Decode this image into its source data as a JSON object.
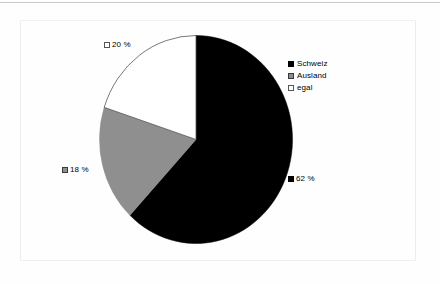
{
  "chart_data": {
    "type": "pie",
    "title": "",
    "subtitle": "",
    "categories": [
      "Schweiz",
      "Ausland",
      "egal"
    ],
    "values": [
      62,
      18,
      20
    ],
    "unit": "%",
    "start_angle_deg": 0,
    "direction": "clockwise",
    "legend_position": "right",
    "grid": false,
    "slice_colors": [
      "#000000",
      "#8f8f8f",
      "#ffffff"
    ],
    "slices": [
      {
        "label": "Schweiz",
        "value": 62,
        "value_text": "62 %",
        "color": "#000000",
        "marker": "black"
      },
      {
        "label": "Ausland",
        "value": 18,
        "value_text": "18 %",
        "color": "#8f8f8f",
        "marker": "gray"
      },
      {
        "label": "egal",
        "value": 20,
        "value_text": "20 %",
        "color": "#ffffff",
        "marker": "white"
      }
    ],
    "data_labels": [
      {
        "id": "egal",
        "text": "20 %",
        "marker": "white"
      },
      {
        "id": "ausland",
        "text": "18 %",
        "marker": "gray"
      },
      {
        "id": "schweiz",
        "text": "62 %",
        "marker": "black"
      }
    ]
  },
  "legend": {
    "entries": [
      {
        "label": "Schweiz",
        "marker": "black"
      },
      {
        "label": "Ausland",
        "marker": "gray"
      },
      {
        "label": "egal",
        "marker": "white"
      }
    ]
  }
}
